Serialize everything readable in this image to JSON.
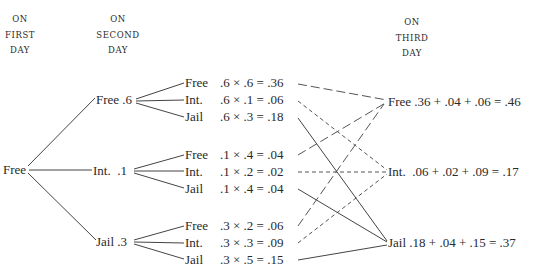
{
  "headers": {
    "first": [
      "ON",
      "FIRST",
      "DAY"
    ],
    "second": [
      "ON",
      "SECOND",
      "DAY"
    ],
    "third": [
      "ON",
      "THIRD",
      "DAY"
    ]
  },
  "root": {
    "label": "Free"
  },
  "second_day": [
    {
      "label": "Free .6"
    },
    {
      "label": "Int.  .1"
    },
    {
      "label": "Jail .3"
    }
  ],
  "leaves": [
    {
      "state": "Free",
      "calc": ".6 × .6 = .36"
    },
    {
      "state": "Int.",
      "calc": ".6 × .1 = .06"
    },
    {
      "state": "Jail",
      "calc": ".6 × .3 = .18"
    },
    {
      "state": "Free",
      "calc": ".1 × .4 = .04"
    },
    {
      "state": "Int.",
      "calc": ".1 × .2 = .02"
    },
    {
      "state": "Jail",
      "calc": ".1 × .4 = .04"
    },
    {
      "state": "Free",
      "calc": ".3 × .2 = .06"
    },
    {
      "state": "Int.",
      "calc": ".3 × .3 = .09"
    },
    {
      "state": "Jail",
      "calc": ".3 × .5 = .15"
    }
  ],
  "third_day": [
    {
      "label": "Free .36 + .04 + .06 = .46"
    },
    {
      "label": "Int.  .06 + .02 + .09 = .17"
    },
    {
      "label": "Jail .18 + .04 + .15 = .37"
    }
  ],
  "line_styles": {
    "to_free": "long-dash",
    "to_int": "short-dash",
    "to_jail": "solid"
  }
}
